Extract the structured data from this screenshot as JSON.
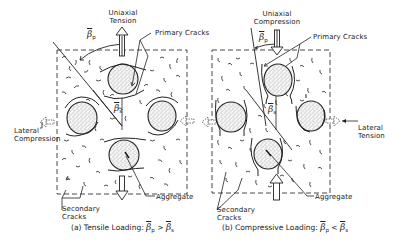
{
  "figure": {
    "panels": [
      {
        "id": "a",
        "loading": "Uniaxial Tension",
        "lateral": "Lateral Compression",
        "primary_cracks": "Primary Cracks",
        "secondary_cracks": "Secondary Cracks",
        "aggregate": "Aggregate",
        "angle_primary": "β",
        "angle_primary_sub": "p",
        "angle_secondary": "β",
        "angle_secondary_sub": "s",
        "caption_prefix": "(a) Tensile Loading:",
        "caption_sym1": "β",
        "caption_sub1": "p",
        "caption_op": ">",
        "caption_sym2": "β",
        "caption_sub2": "s"
      },
      {
        "id": "b",
        "loading": "Uniaxial Compression",
        "lateral": "Lateral Tension",
        "primary_cracks": "Primary Cracks",
        "secondary_cracks": "Secondary Cracks",
        "aggregate": "Aggregate",
        "angle_primary": "β",
        "angle_primary_sub": "p",
        "angle_secondary": "β",
        "angle_secondary_sub": "s",
        "caption_prefix": "(b) Compressive Loading:",
        "caption_sym1": "β",
        "caption_sub1": "p",
        "caption_op": "<",
        "caption_sym2": "β",
        "caption_sub2": "s"
      }
    ],
    "colors": {
      "ink": "#222222",
      "background": "#ffffff"
    }
  }
}
